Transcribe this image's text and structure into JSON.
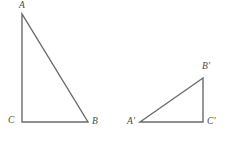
{
  "figure": {
    "kind": "geometry-diagram",
    "stroke_color": "#6b6b6b",
    "stroke_width": 1.4,
    "label_color": "#4a4a4a",
    "background_color": "#ffffff",
    "width": 230,
    "height": 142,
    "triangles": [
      {
        "name": "triangle-abc",
        "right_angle_at": "C",
        "vertices": [
          {
            "label": "A",
            "x": 22,
            "y": 14
          },
          {
            "label": "C",
            "x": 22,
            "y": 122
          },
          {
            "label": "B",
            "x": 88,
            "y": 122
          }
        ],
        "path": "M 22 14 L 22 122 L 88 122 Z"
      },
      {
        "name": "triangle-a-prime-b-prime-c-prime",
        "right_angle_at": "C'",
        "vertices": [
          {
            "label": "A'",
            "x": 140,
            "y": 122
          },
          {
            "label": "B'",
            "x": 203,
            "y": 78
          },
          {
            "label": "C'",
            "x": 203,
            "y": 122
          }
        ],
        "path": "M 140 122 L 203 78 L 203 122 Z"
      }
    ],
    "labels": {
      "a": "A",
      "b": "B",
      "c": "C",
      "a_prime": "A'",
      "b_prime": "B'",
      "c_prime": "C'"
    }
  }
}
